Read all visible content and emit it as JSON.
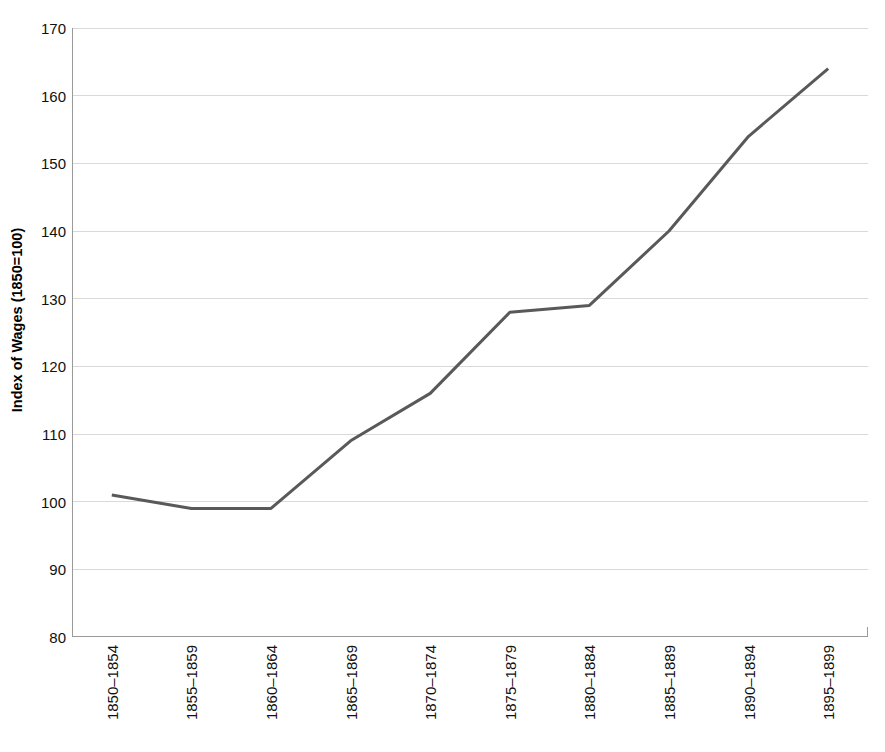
{
  "chart_data": {
    "type": "line",
    "title": "",
    "xlabel": "",
    "ylabel": "Index of Wages (1850=100)",
    "categories": [
      "1850–1854",
      "1855–1859",
      "1860–1864",
      "1865–1869",
      "1870–1874",
      "1875–1879",
      "1880–1884",
      "1885–1889",
      "1890–1894",
      "1895–1899"
    ],
    "values": [
      101,
      99,
      99,
      109,
      116,
      128,
      129,
      140,
      154,
      164
    ],
    "ylim": [
      80,
      170
    ],
    "yticks": [
      80,
      90,
      100,
      110,
      120,
      130,
      140,
      150,
      160,
      170
    ],
    "ytick_labels": [
      "80",
      "90",
      "100",
      "110",
      "120",
      "130",
      "140",
      "150",
      "160",
      "170"
    ],
    "grid": true,
    "legend": false,
    "series": [
      {
        "name": "Index of Wages",
        "color": "#595959",
        "values": [
          101,
          99,
          99,
          109,
          116,
          128,
          129,
          140,
          154,
          164
        ]
      }
    ],
    "colors": {
      "line": "#595959",
      "gridline": "#d9d9d9",
      "axis": "#9a9a9a",
      "background": "#ffffff",
      "text": "#111111"
    }
  }
}
